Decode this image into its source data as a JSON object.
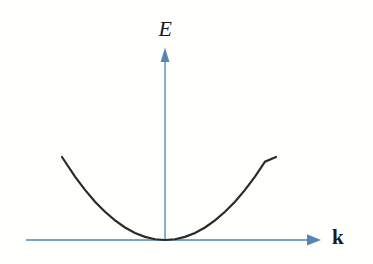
{
  "figure": {
    "kind": "physics-dispersion-sketch",
    "background_color": "#fffffe",
    "width": 373,
    "height": 264
  },
  "axes": {
    "vertical": {
      "label": "E",
      "icon": "arrow-up-icon",
      "color": "#7ba7c7",
      "arrowhead_color": "#5585b0"
    },
    "horizontal": {
      "label": "k",
      "icon": "arrow-right-icon",
      "color": "#7ba7c7",
      "arrowhead_color": "#5585b0"
    }
  },
  "chart_data": {
    "type": "line",
    "title": "",
    "subtitle": "",
    "xlabel": "k",
    "ylabel": "E",
    "grid": false,
    "legend": null,
    "annotations": [],
    "curve_color": "#2a2a2a",
    "curve_width": 2.2,
    "origin_px": [
      165,
      240
    ],
    "xlim": [
      -1.03,
      1.11
    ],
    "ylim": [
      0,
      1
    ],
    "series": [
      {
        "name": "E(k)",
        "relation": "E = A*k^2",
        "x": [
          -1.03,
          -0.9,
          -0.8,
          -0.7,
          -0.6,
          -0.5,
          -0.4,
          -0.3,
          -0.2,
          -0.1,
          0,
          0.1,
          0.2,
          0.3,
          0.4,
          0.5,
          0.6,
          0.7,
          0.8,
          0.9,
          1.0,
          1.11
        ],
        "y": [
          1.0,
          0.764,
          0.604,
          0.462,
          0.34,
          0.236,
          0.151,
          0.085,
          0.038,
          0.009,
          0,
          0.009,
          0.038,
          0.085,
          0.151,
          0.236,
          0.34,
          0.462,
          0.604,
          0.764,
          0.943,
          1.0
        ]
      }
    ],
    "endpoints_px": {
      "left": [
        62,
        157
      ],
      "vertex": [
        165,
        239
      ],
      "right": [
        276,
        157
      ]
    }
  }
}
